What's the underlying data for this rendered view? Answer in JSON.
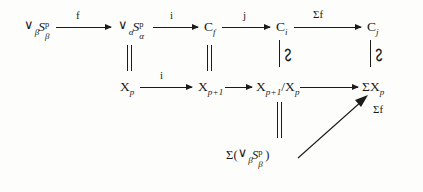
{
  "figure": {
    "kind": "commutative-diagram",
    "background_color": "#fdfdfb",
    "ink_color": "#1b1b1b"
  },
  "nodes": {
    "wedge_beta_S": {
      "wedge": "∨",
      "presub": "β",
      "base": "S",
      "sup": "p",
      "sub": "β"
    },
    "wedge_alpha_S": {
      "wedge": "∨",
      "presub": "α",
      "base": "S",
      "sup": "p",
      "sub": "α"
    },
    "C_f": {
      "base": "C",
      "sub": "f"
    },
    "C_i": {
      "base": "C",
      "sub": "i"
    },
    "C_j": {
      "base": "C",
      "sub": "j"
    },
    "X_p": {
      "base": "X",
      "sub": "p"
    },
    "X_p1": {
      "base": "X",
      "sub": "p+1"
    },
    "X_quot": {
      "base": "X",
      "sub": "p+1",
      "slash": "/",
      "base2": "X",
      "sub2": "p"
    },
    "Sigma_X_p": {
      "sigma": "Σ",
      "base": "X",
      "sub": "p"
    },
    "Sigma_wedge": {
      "sigma": "Σ",
      "open": "(",
      "wedge": "∨",
      "presub": "β",
      "base": "S",
      "sup": "p",
      "sub": "β",
      "close": ")"
    }
  },
  "arrow_labels": {
    "f": "f",
    "i_top": "i",
    "j": "j",
    "sigma_f_top": "Σf",
    "i_bottom": "i",
    "sigma_f_diag": "Σf"
  },
  "relations": {
    "equality": "‖",
    "iso": "≅"
  }
}
